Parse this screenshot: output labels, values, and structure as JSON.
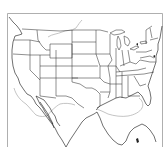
{
  "map": {
    "title": "United States state outline map",
    "region": "Contiguous United States with northern Mexico, Gulf of Mexico and Yucatán",
    "style": "black line outline on white",
    "colors": {
      "background": "#ffffff",
      "state_lines": "#333333",
      "coastline": "#222222",
      "offshore_contour": "#b5b5b5",
      "frame": "#9a9a9a"
    },
    "visible_features": [
      "state-boundaries",
      "great-lakes",
      "gulf-of-mexico",
      "baja-california",
      "gulf-of-california",
      "florida-peninsula",
      "yucatan-peninsula",
      "offshore-contour-line"
    ]
  }
}
